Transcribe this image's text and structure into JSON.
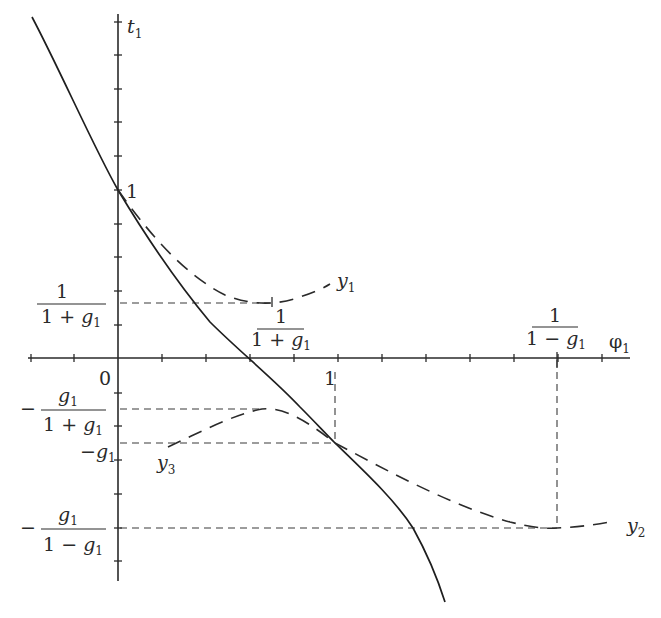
{
  "figure": {
    "axes": {
      "x_label": "φ",
      "x_label_sub": "1",
      "y_label": "t",
      "y_label_sub": "1",
      "origin_label": "0",
      "x_unit_label": "1",
      "y_unit_label": "1"
    },
    "levels": {
      "one_over_one_plus_g": {
        "num": "1",
        "den_pre": "1 + ",
        "den_var": "g",
        "den_sub": "1"
      },
      "neg_g_over_one_plus_g": {
        "sign": "−",
        "num_var": "g",
        "num_sub": "1",
        "den_pre": "1 + ",
        "den_var": "g",
        "den_sub": "1"
      },
      "neg_g": {
        "sign": "−",
        "var": "g",
        "sub": "1"
      },
      "neg_g_over_one_minus_g": {
        "sign": "−",
        "num_var": "g",
        "num_sub": "1",
        "den_pre": "1 − ",
        "den_var": "g",
        "den_sub": "1"
      }
    },
    "x_markers": {
      "one_over_one_plus_g": {
        "num": "1",
        "den_pre": "1 + ",
        "den_var": "g",
        "den_sub": "1"
      },
      "one_over_one_minus_g": {
        "num": "1",
        "den_pre": "1 − ",
        "den_var": "g",
        "den_sub": "1"
      }
    },
    "curves": [
      {
        "name": "t1",
        "style": "solid",
        "label": ""
      },
      {
        "name": "y1",
        "style": "dashed",
        "label": "y",
        "label_sub": "1"
      },
      {
        "name": "y2",
        "style": "dashed",
        "label": "y",
        "label_sub": "2"
      },
      {
        "name": "y3",
        "style": "dashed",
        "label": "y",
        "label_sub": "3"
      }
    ],
    "colors": {
      "ink": "#2a2a2a",
      "background": "#ffffff"
    }
  },
  "chart_data": {
    "type": "line",
    "title": "",
    "xlabel": "φ1",
    "ylabel": "t1",
    "grid": false,
    "legend": "inline labels next to curves",
    "pixel_frame": {
      "origin_px": [
        118,
        358
      ],
      "x_tick_px": 44,
      "y_tick_px": 33.6,
      "x_ticks_per_unit": 5
    },
    "x_ticks_px": [
      31,
      74,
      118,
      162,
      206,
      250,
      294,
      338,
      382,
      426,
      470,
      514,
      558,
      602
    ],
    "y_ticks_px": [
      22,
      55,
      89,
      122,
      156,
      190,
      224,
      257,
      291,
      325,
      358,
      393,
      426,
      460,
      494,
      528,
      561
    ],
    "annotations": [
      {
        "text": "1",
        "at": "t1 = 1 on vertical axis"
      },
      {
        "text": "1",
        "at": "φ1 = 1 on horizontal axis"
      },
      {
        "text": "1/(1+g1)",
        "at": "horizontal level and φ1-position of y1 minimum"
      },
      {
        "text": "1/(1−g1)",
        "at": "φ1-position of y2 minimum"
      },
      {
        "text": "−g1/(1+g1)",
        "at": "level of y3 maximum"
      },
      {
        "text": "−g1",
        "at": "level where curves meet at φ1 = 1"
      },
      {
        "text": "−g1/(1−g1)",
        "at": "level of y2 minimum"
      }
    ],
    "series": [
      {
        "name": "t1 (solid)",
        "points_px": [
          [
            32,
            17
          ],
          [
            75,
            100
          ],
          [
            118,
            190
          ],
          [
            160,
            258
          ],
          [
            198,
            310
          ],
          [
            250,
            358
          ],
          [
            300,
            407
          ],
          [
            335,
            443
          ],
          [
            375,
            490
          ],
          [
            413,
            528
          ],
          [
            445,
            602
          ]
        ]
      },
      {
        "name": "y1 (dashed)",
        "points_px": [
          [
            118,
            190
          ],
          [
            160,
            240
          ],
          [
            200,
            278
          ],
          [
            240,
            298
          ],
          [
            272,
            303
          ],
          [
            300,
            298
          ],
          [
            330,
            284
          ]
        ]
      },
      {
        "name": "y2 (dashed)",
        "points_px": [
          [
            335,
            443
          ],
          [
            400,
            476
          ],
          [
            460,
            505
          ],
          [
            510,
            522
          ],
          [
            557,
            528
          ],
          [
            590,
            526
          ],
          [
            615,
            521
          ]
        ]
      },
      {
        "name": "y3 (dashed)",
        "points_px": [
          [
            168,
            447
          ],
          [
            215,
            425
          ],
          [
            262,
            409
          ],
          [
            300,
            418
          ],
          [
            335,
            443
          ]
        ]
      }
    ],
    "guides_px": [
      {
        "type": "h",
        "y": 303,
        "x1": 118,
        "x2": 272
      },
      {
        "type": "h",
        "y": 409,
        "x1": 118,
        "x2": 262
      },
      {
        "type": "h",
        "y": 443,
        "x1": 118,
        "x2": 335
      },
      {
        "type": "h",
        "y": 528,
        "x1": 118,
        "x2": 557
      },
      {
        "type": "v",
        "x": 335,
        "y1": 372,
        "y2": 443
      },
      {
        "type": "v",
        "x": 557,
        "y1": 360,
        "y2": 528
      }
    ]
  }
}
